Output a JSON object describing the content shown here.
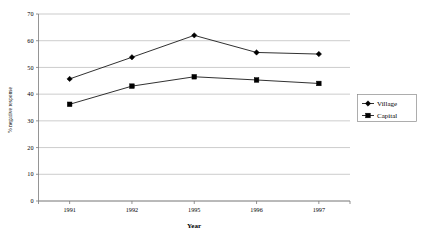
{
  "chart_data": {
    "type": "line",
    "title": "",
    "xlabel": "Year",
    "ylabel": "% negative response",
    "categories": [
      "1991",
      "1992",
      "1995",
      "1996",
      "1997"
    ],
    "ylim": [
      0,
      70
    ],
    "yticks": [
      "0",
      "10",
      "20",
      "30",
      "40",
      "50",
      "60",
      "70"
    ],
    "grid": true,
    "legend_position": "right",
    "series": [
      {
        "name": "Village",
        "marker": "diamond",
        "color": "#000000",
        "values": [
          45.7,
          53.8,
          62.0,
          55.6,
          55.0
        ]
      },
      {
        "name": "Capital",
        "marker": "square",
        "color": "#000000",
        "values": [
          36.2,
          43.0,
          46.5,
          45.3,
          44.0
        ]
      }
    ]
  },
  "axes": {
    "y_title": "% negative response",
    "x_title": "Year",
    "y_ticks": [
      "70",
      "60",
      "50",
      "40",
      "30",
      "20",
      "10",
      "0"
    ],
    "x_ticks": [
      "1991",
      "1992",
      "1995",
      "1996",
      "1997"
    ]
  },
  "legend": {
    "entries": [
      {
        "label": "Village",
        "marker": "diamond"
      },
      {
        "label": "Capital",
        "marker": "square"
      }
    ]
  },
  "colors": {
    "series_line": "#1a1a1a",
    "gridline": "#b6b6b6",
    "axis": "#7a7a7a",
    "background": "#ffffff"
  }
}
